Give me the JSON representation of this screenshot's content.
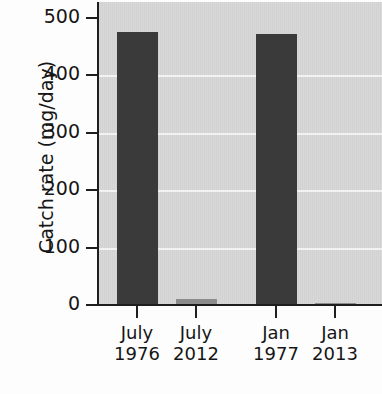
{
  "chart_data": {
    "type": "bar",
    "title": "",
    "xlabel": "",
    "ylabel": "Catch rate (mg/day)",
    "categories": [
      "July 1976",
      "July 2012",
      "Jan 1977",
      "Jan 2013"
    ],
    "category_lines": [
      [
        "July",
        "1976"
      ],
      [
        "July",
        "2012"
      ],
      [
        "Jan",
        "1977"
      ],
      [
        "Jan",
        "2013"
      ]
    ],
    "values": [
      475,
      10,
      473,
      3
    ],
    "ylim": [
      0,
      500
    ],
    "yticks": [
      0,
      100,
      200,
      300,
      400,
      500
    ],
    "ytick_labels": [
      "0",
      "100",
      "200",
      "300",
      "400",
      "500"
    ],
    "grid": "horizontal-white-on-gray",
    "legend": "none",
    "bar_colors": [
      "#3a3a3a",
      "#8d8d8d",
      "#3a3a3a",
      "#8d8d8d"
    ],
    "plot_background": "#d6d6d6",
    "gridline_color": "#f2f2f2",
    "axis_color": "#1e1e1e",
    "text_color": "#161616"
  }
}
